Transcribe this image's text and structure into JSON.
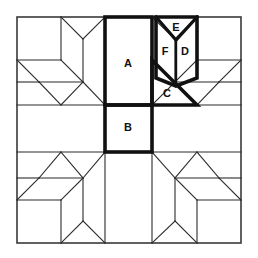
{
  "diagram": {
    "type": "quilt-block-line-drawing",
    "background_color": "#ffffff",
    "line_color": "#2b2b2b",
    "bold_line_color": "#111111",
    "frame_color": "#3a3a3a",
    "label_color": "#111111",
    "canvas": {
      "width": 258,
      "height": 258
    },
    "grid": {
      "x_lines": [
        17,
        105,
        152,
        241
      ],
      "y_lines": [
        17,
        105,
        152,
        243
      ],
      "columns": 3,
      "rows": 3
    },
    "labels": [
      {
        "id": "A",
        "text": "A",
        "x": 128,
        "y": 64,
        "shape": "rectangle",
        "description": "tall center rectangle in top band"
      },
      {
        "id": "B",
        "text": "B",
        "x": 128,
        "y": 128,
        "shape": "square",
        "description": "center square in middle band"
      },
      {
        "id": "C",
        "text": "C",
        "x": 167,
        "y": 94,
        "shape": "right-triangle",
        "description": "triangle below the chevron"
      },
      {
        "id": "D",
        "text": "D",
        "x": 183,
        "y": 52,
        "shape": "half-chevron",
        "description": "right half of chevron"
      },
      {
        "id": "E",
        "text": "E",
        "x": 176,
        "y": 28,
        "shape": "small-triangle",
        "description": "top notch of chevron"
      },
      {
        "id": "F",
        "text": "F",
        "x": 163,
        "y": 52,
        "shape": "half-chevron",
        "description": "left half of chevron"
      }
    ],
    "bold_outlines": [
      "center-column-A-B",
      "chevron-E-F-D",
      "triangle-C"
    ],
    "corner_blocks": [
      {
        "position": "top-left",
        "motif": "star-point-with-cube"
      },
      {
        "position": "top-right",
        "motif": "star-point-with-cube"
      },
      {
        "position": "bottom-left",
        "motif": "star-point-with-cube"
      },
      {
        "position": "bottom-right",
        "motif": "star-point-with-cube"
      }
    ]
  }
}
